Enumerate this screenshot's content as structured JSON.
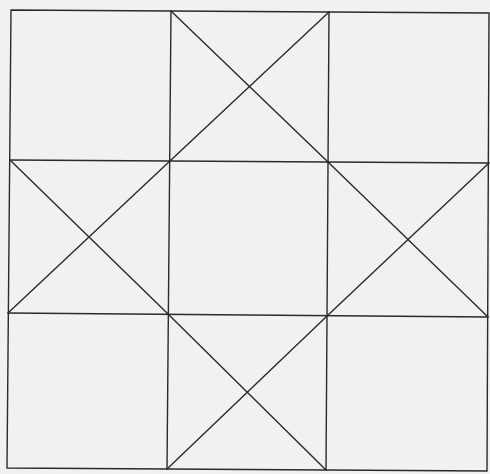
{
  "diagram": {
    "title": "",
    "background": "#f1f1f1",
    "stroke_color": "#2a2a2a",
    "type": "quilt-block-line-drawing",
    "outer_square": [
      [
        11,
        10
      ],
      [
        489,
        13
      ],
      [
        487,
        471
      ],
      [
        7,
        468
      ]
    ],
    "grid_lines": [
      {
        "name": "vertical-left",
        "x1": 171,
        "y1": 11,
        "x2": 167,
        "y2": 469
      },
      {
        "name": "vertical-right",
        "x1": 329,
        "y1": 12,
        "x2": 326,
        "y2": 470
      },
      {
        "name": "horizontal-top",
        "x1": 10,
        "y1": 160,
        "x2": 489,
        "y2": 163
      },
      {
        "name": "horizontal-bottom",
        "x1": 8,
        "y1": 313,
        "x2": 488,
        "y2": 317
      }
    ],
    "diagonals": [
      {
        "name": "top-diagonal-a",
        "x1": 171,
        "y1": 11,
        "x2": 329,
        "y2": 163
      },
      {
        "name": "top-diagonal-b",
        "x1": 329,
        "y1": 12,
        "x2": 171,
        "y2": 160
      },
      {
        "name": "left-diagonal-a",
        "x1": 10,
        "y1": 160,
        "x2": 167,
        "y2": 313
      },
      {
        "name": "left-diagonal-b",
        "x1": 171,
        "y1": 160,
        "x2": 8,
        "y2": 313
      },
      {
        "name": "right-diagonal-a",
        "x1": 329,
        "y1": 163,
        "x2": 488,
        "y2": 317
      },
      {
        "name": "right-diagonal-b",
        "x1": 489,
        "y1": 163,
        "x2": 326,
        "y2": 317
      },
      {
        "name": "bottom-diagonal-a",
        "x1": 167,
        "y1": 313,
        "x2": 326,
        "y2": 470
      },
      {
        "name": "bottom-diagonal-b",
        "x1": 326,
        "y1": 317,
        "x2": 167,
        "y2": 469
      }
    ]
  }
}
